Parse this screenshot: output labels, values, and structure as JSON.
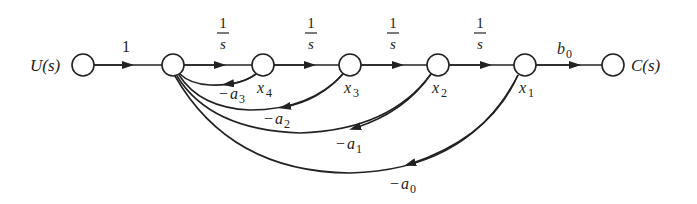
{
  "diagram": {
    "type": "signal-flow-graph",
    "input": {
      "label": "U(s)"
    },
    "output": {
      "label": "C(s)"
    },
    "input_gain": "1",
    "output_gain": {
      "base": "b",
      "sub": "0"
    },
    "integrator_gain": {
      "num": "1",
      "den": "s"
    },
    "states": [
      {
        "base": "x",
        "sub": "4"
      },
      {
        "base": "x",
        "sub": "3"
      },
      {
        "base": "x",
        "sub": "2"
      },
      {
        "base": "x",
        "sub": "1"
      }
    ],
    "feedback": [
      {
        "base": "a",
        "sub": "3",
        "prefix": "−"
      },
      {
        "base": "a",
        "sub": "2",
        "prefix": "−"
      },
      {
        "base": "a",
        "sub": "1",
        "prefix": "−"
      },
      {
        "base": "a",
        "sub": "0",
        "prefix": "−"
      }
    ]
  }
}
